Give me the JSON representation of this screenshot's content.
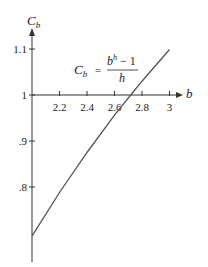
{
  "chart_data": {
    "type": "line",
    "title": "",
    "xlabel": "b",
    "ylabel": "C_b",
    "ylabel_main": "C",
    "ylabel_sub": "b",
    "xlim": [
      2.0,
      3.05
    ],
    "ylim": [
      0.68,
      1.14
    ],
    "grid": false,
    "x_axis_crosses_at_y": 1,
    "x_ticks": [
      2.2,
      2.4,
      2.6,
      2.8,
      3
    ],
    "x_tick_labels": [
      "2.2",
      "2.4",
      "2.6",
      "2.8",
      "3"
    ],
    "y_ticks": [
      0.8,
      0.9,
      1,
      1.1
    ],
    "y_tick_labels": [
      ".8",
      ".9",
      "1",
      "1.1"
    ],
    "series": [
      {
        "name": "C_b = (b^h - 1)/h",
        "x": [
          2.0,
          2.2,
          2.4,
          2.6,
          2.718,
          2.8,
          3.0
        ],
        "values": [
          0.693,
          0.788,
          0.875,
          0.956,
          1.0,
          1.03,
          1.099
        ]
      }
    ],
    "annotation": {
      "lhs_main": "C",
      "lhs_sub": "b",
      "equals": "=",
      "numerator_base": "b",
      "numerator_exp": "h",
      "numerator_rest": " − 1",
      "denominator": "h"
    }
  }
}
